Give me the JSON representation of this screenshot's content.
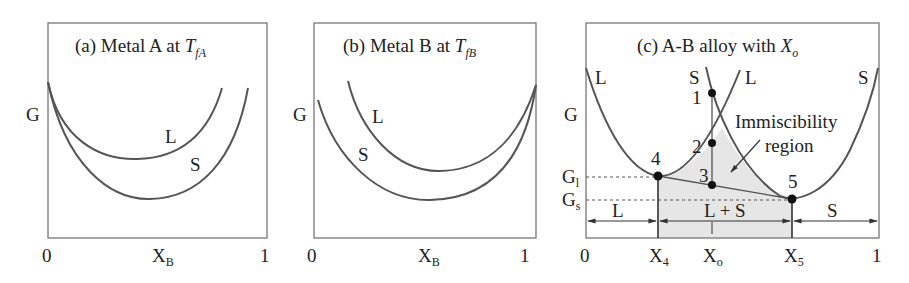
{
  "panels": [
    {
      "id": "a",
      "title_prefix": "(a)  Metal A at ",
      "title_var": "T",
      "title_sub": "fA",
      "y_label": "G",
      "x_tick_left": "0",
      "x_tick_right": "1",
      "x_label": "X",
      "x_label_sub": "B",
      "curve_labels": {
        "liquid": "L",
        "solid": "S"
      }
    },
    {
      "id": "b",
      "title_prefix": "(b)  Metal B at ",
      "title_var": "T",
      "title_sub": "fB",
      "y_label": "G",
      "x_tick_left": "0",
      "x_tick_right": "1",
      "x_label": "X",
      "x_label_sub": "B",
      "curve_labels": {
        "liquid": "L",
        "solid": "S"
      }
    },
    {
      "id": "c",
      "title_prefix": "(c)  A-B alloy with ",
      "title_var": "X",
      "title_sub": "o",
      "y_label": "G",
      "g_levels": {
        "gl": "G",
        "gl_sub": "l",
        "gs": "G",
        "gs_sub": "s"
      },
      "x_ticks": [
        {
          "label": "0",
          "sub": ""
        },
        {
          "label": "X",
          "sub": "4"
        },
        {
          "label": "X",
          "sub": "o"
        },
        {
          "label": "X",
          "sub": "5"
        },
        {
          "label": "1",
          "sub": ""
        }
      ],
      "curve_labels": {
        "liquid_left": "L",
        "solid_mid": "S",
        "liquid_mid": "L",
        "solid_right": "S"
      },
      "points": [
        "1",
        "2",
        "3",
        "4",
        "5"
      ],
      "annotation_line1": "Immiscibility",
      "annotation_line2": "region",
      "regions": {
        "left": "L",
        "middle": "L + S",
        "right": "S"
      }
    }
  ],
  "colors": {
    "curve": "#555555",
    "frame": "#777777",
    "fill": "#e6e6e6",
    "text": "#222222"
  }
}
